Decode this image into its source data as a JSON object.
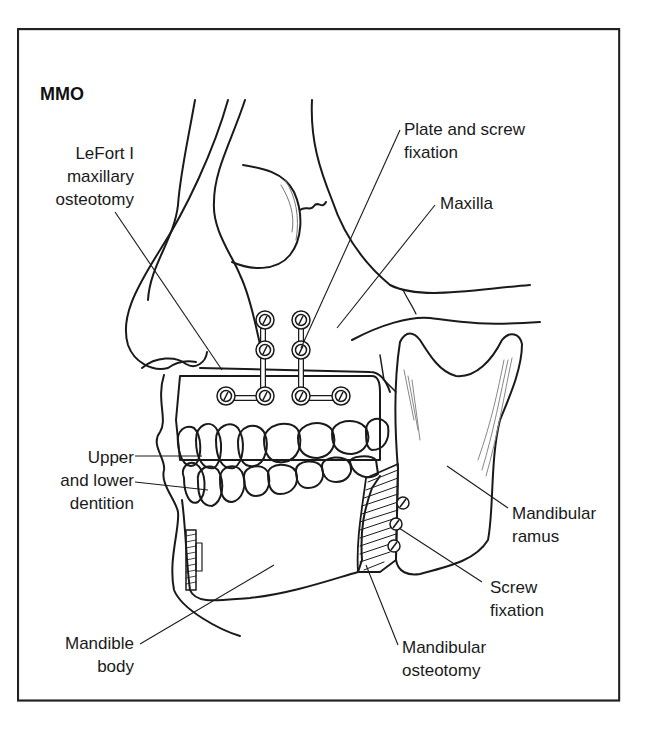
{
  "figure": {
    "title": "MMO",
    "labels": {
      "lefort": "LeFort I\nmaxillary\nosteotomy",
      "plate_screw": "Plate and screw\nfixation",
      "maxilla": "Maxilla",
      "dentition": "Upper\nand lower\ndentition",
      "mandible_body": "Mandible\nbody",
      "mandibular_osteotomy": "Mandibular\nosteotomy",
      "screw_fixation": "Screw\nfixation",
      "mandibular_ramus": "Mandibular\nramus"
    },
    "colors": {
      "line": "#1a1a1a",
      "background": "#ffffff",
      "frame": "#222222"
    }
  }
}
